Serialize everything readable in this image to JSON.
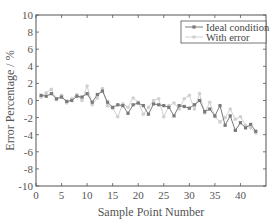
{
  "chart_data": {
    "type": "line",
    "title": "",
    "xlabel": "Sample Point Number",
    "ylabel": "Error Percentage / %",
    "xlim": [
      0,
      45
    ],
    "ylim": [
      -10,
      10
    ],
    "xticks": [
      0,
      5,
      10,
      15,
      20,
      25,
      30,
      35,
      40
    ],
    "yticks": [
      -10,
      -8,
      -6,
      -4,
      -2,
      0,
      2,
      4,
      6,
      8,
      10
    ],
    "grid": false,
    "legend_position": "top-right",
    "x": [
      1,
      2,
      3,
      4,
      5,
      6,
      7,
      8,
      9,
      10,
      11,
      12,
      13,
      14,
      15,
      16,
      17,
      18,
      19,
      20,
      21,
      22,
      23,
      24,
      25,
      26,
      27,
      28,
      29,
      30,
      31,
      32,
      33,
      34,
      35,
      36,
      37,
      38,
      39,
      40,
      41,
      42,
      43
    ],
    "series": [
      {
        "name": "Ideal condition",
        "color": "#7a7a7a",
        "marker": "square",
        "values": [
          0.6,
          0.5,
          0.8,
          0.2,
          0.4,
          -0.1,
          0.0,
          0.5,
          0.4,
          0.8,
          -0.2,
          0.7,
          1.1,
          -0.2,
          -0.8,
          -0.5,
          -0.6,
          -1.5,
          -0.5,
          -0.3,
          -0.6,
          -1.6,
          -0.4,
          -0.5,
          -0.6,
          -0.8,
          -1.8,
          -0.6,
          -0.7,
          -0.9,
          -0.5,
          0.0,
          -1.3,
          -1.0,
          -1.8,
          -0.6,
          -2.9,
          -1.8,
          -3.5,
          -2.6,
          -3.2,
          -2.8,
          -3.6
        ]
      },
      {
        "name": "With error",
        "color": "#d0d0d0",
        "marker": "circle",
        "values": [
          0.4,
          0.9,
          1.3,
          0.1,
          0.6,
          -0.3,
          0.2,
          0.7,
          0.0,
          1.7,
          -0.5,
          0.3,
          1.4,
          -0.6,
          -0.9,
          -1.9,
          -0.4,
          -0.8,
          0.3,
          -0.2,
          -1.6,
          -0.8,
          0.0,
          0.2,
          -1.9,
          -0.6,
          -0.3,
          -1.0,
          0.2,
          0.6,
          -1.0,
          0.8,
          -1.5,
          -0.2,
          -1.9,
          -2.5,
          -2.0,
          -1.0,
          -2.2,
          -1.9,
          -2.9,
          -3.2,
          -3.8
        ]
      }
    ]
  }
}
